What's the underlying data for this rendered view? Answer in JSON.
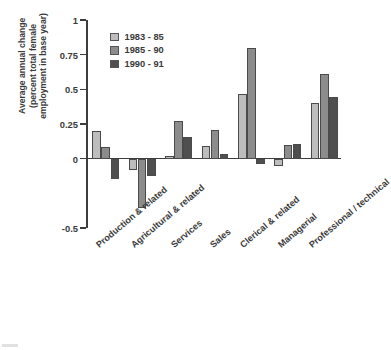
{
  "chart_data": {
    "type": "bar",
    "title": "",
    "subtitle": "",
    "xlabel": "",
    "ylabel_lines": [
      "Average annual change",
      "(percent total female",
      "employment in base year)"
    ],
    "ylabel": "Average annual change (percent total female employment in base year)",
    "categories": [
      "Production & related",
      "Agricultural & related",
      "Services",
      "Sales",
      "Clerical & related",
      "Managerial",
      "Professional / technical"
    ],
    "series": [
      {
        "name": "1983 - 85",
        "color": "#bdbdbd",
        "values": [
          0.2,
          -0.08,
          0.02,
          0.09,
          0.465,
          -0.05,
          0.4
        ]
      },
      {
        "name": "1985 - 90",
        "color": "#8c8c8c",
        "values": [
          0.085,
          -0.355,
          0.275,
          0.21,
          0.8,
          0.095,
          0.61
        ]
      },
      {
        "name": "1990 - 91",
        "color": "#4f4f4f",
        "values": [
          -0.145,
          -0.125,
          0.155,
          0.035,
          -0.035,
          0.105,
          0.445
        ]
      }
    ],
    "ylim": [
      -0.5,
      1
    ],
    "ytick_values": [
      1,
      0.75,
      0.5,
      0.25,
      0,
      -0.5
    ],
    "ytick_labels": [
      "1",
      "0.75",
      "0.5",
      "0.25",
      "0",
      "-0.5"
    ],
    "grid": false,
    "legend_position": "upper-left-inside",
    "legend_entries": [
      "1983 - 85",
      "1985 - 90",
      "1990 - 91"
    ]
  },
  "axis": {
    "line_color": "#3d3d3d",
    "text_color": "#3a3a3a"
  }
}
